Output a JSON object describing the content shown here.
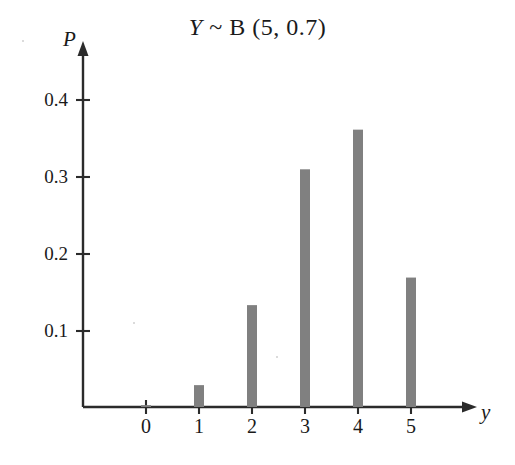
{
  "chart_data": {
    "type": "bar",
    "title_parts": {
      "variable": "Y",
      "tilde": "~",
      "distribution": "B",
      "params": "(5, 0.7)"
    },
    "xlabel": "y",
    "ylabel": "P",
    "categories": [
      "0",
      "1",
      "2",
      "3",
      "4",
      "5"
    ],
    "values": [
      0.0024,
      0.0284,
      0.1323,
      0.3087,
      0.3602,
      0.1681
    ],
    "ytick_labels": [
      "0.1",
      "0.2",
      "0.3",
      "0.4"
    ],
    "ytick_values": [
      0.1,
      0.2,
      0.3,
      0.4
    ],
    "ylim": [
      0,
      0.46
    ],
    "xlim": [
      -0.6,
      6.0
    ],
    "grid": false,
    "legend": null,
    "bar_color": "#808080",
    "axis_color": "#2b2b2b"
  },
  "axes": {
    "y_axis_name": "probability-axis",
    "x_axis_name": "outcome-axis"
  }
}
